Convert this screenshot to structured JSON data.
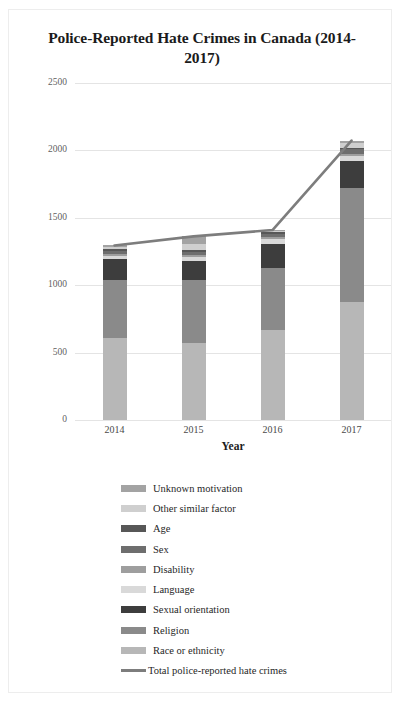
{
  "chart_data": {
    "type": "bar",
    "subtype": "stacked-bar-with-line",
    "title": "Police-Reported Hate Crimes in Canada (2014-2017)",
    "xlabel": "Year",
    "ylabel": "# of Hate Crimes",
    "categories": [
      "2014",
      "2015",
      "2016",
      "2017"
    ],
    "ylim": [
      0,
      2500
    ],
    "yticks": [
      0,
      500,
      1000,
      1500,
      2000,
      2500
    ],
    "ytick_labels": [
      "0",
      "500",
      "1000",
      "1500",
      "2000",
      "2500"
    ],
    "grid": true,
    "legend_position": "bottom",
    "series": [
      {
        "name": "Race or ethnicity",
        "values": [
          611,
          571,
          666,
          878
        ],
        "color": "#b7b7b7"
      },
      {
        "name": "Religion",
        "values": [
          429,
          469,
          460,
          842
        ],
        "color": "#8a8a8a"
      },
      {
        "name": "Sexual orientation",
        "values": [
          155,
          141,
          176,
          204
        ],
        "color": "#3d3d3d"
      },
      {
        "name": "Language",
        "values": [
          22,
          27,
          40,
          33
        ],
        "color": "#d9d9d9"
      },
      {
        "name": "Disability",
        "values": [
          12,
          16,
          16,
          19
        ],
        "color": "#9e9e9e"
      },
      {
        "name": "Sex",
        "values": [
          26,
          25,
          24,
          32
        ],
        "color": "#6e6e6e"
      },
      {
        "name": "Age",
        "values": [
          14,
          10,
          9,
          13
        ],
        "color": "#575757"
      },
      {
        "name": "Other similar factor",
        "values": [
          17,
          44,
          8,
          31
        ],
        "color": "#cfcfcf"
      },
      {
        "name": "Unknown motivation",
        "values": [
          9,
          59,
          10,
          21
        ],
        "color": "#a3a3a3"
      }
    ],
    "line_series": {
      "name": "Total police-reported hate crimes",
      "values": [
        1295,
        1362,
        1409,
        2073
      ],
      "color": "#7d7d7d"
    }
  },
  "legend": {
    "items": [
      {
        "label": "Unknown motivation",
        "swatch": "#a3a3a3",
        "type": "box"
      },
      {
        "label": "Other similar factor",
        "swatch": "#cfcfcf",
        "type": "box"
      },
      {
        "label": "Age",
        "swatch": "#575757",
        "type": "box"
      },
      {
        "label": "Sex",
        "swatch": "#6e6e6e",
        "type": "box"
      },
      {
        "label": "Disability",
        "swatch": "#9e9e9e",
        "type": "box"
      },
      {
        "label": "Language",
        "swatch": "#d9d9d9",
        "type": "box"
      },
      {
        "label": "Sexual orientation",
        "swatch": "#3d3d3d",
        "type": "box"
      },
      {
        "label": "Religion",
        "swatch": "#8a8a8a",
        "type": "box"
      },
      {
        "label": "Race or ethnicity",
        "swatch": "#b7b7b7",
        "type": "box"
      },
      {
        "label": "Total police-reported hate crimes",
        "swatch": "#7d7d7d",
        "type": "line"
      }
    ]
  },
  "colors": {
    "grid": "#e4e4e4",
    "frame_border": "#ededed",
    "text": "#1b1b1b",
    "background": "#ffffff"
  }
}
